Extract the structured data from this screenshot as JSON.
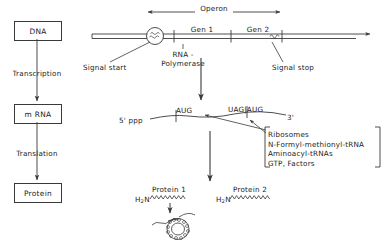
{
  "diagram": {
    "title_flow": {
      "dna": "DNA",
      "transcription": "Transcription",
      "mrna": "m RNA",
      "translation": "Translation",
      "protein": "Protein"
    },
    "operon": {
      "span_label": "Operon",
      "gene1": "Gen 1",
      "gene2": "Gen 2",
      "polymerase": "RNA -\nPolymerase",
      "polymerase_line1": "RNA -",
      "polymerase_line2": "Polymerase",
      "signal_start": "Signal start",
      "signal_stop": "Signal stop"
    },
    "mrna_strand": {
      "five_prime": "5' ppp",
      "start_codon_1": "AUG",
      "stop_start_codons": "UAG|AUG",
      "three_prime": "3'"
    },
    "translation_factors": {
      "items": [
        "Ribosomes",
        "N-Formyl-methionyl-tRNA",
        "Aminoacyl-tRNAs",
        "GTP, Factors"
      ]
    },
    "proteins": {
      "protein1_label": "Protein 1",
      "protein2_label": "Protein 2",
      "amino_terminus": "H2N"
    },
    "colors": {
      "ink": "#1a1a1a",
      "line": "#3a3a3a",
      "background": "#ffffff"
    }
  }
}
